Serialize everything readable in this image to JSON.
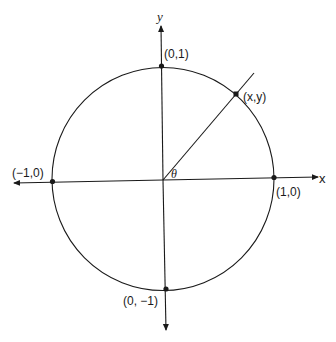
{
  "diagram": {
    "type": "unit-circle",
    "colors": {
      "stroke": "#1a1a1a",
      "background": "#ffffff"
    },
    "axes": {
      "x_label": "x",
      "y_label": "y"
    },
    "angle_label": "θ",
    "points": {
      "top": "(0,1)",
      "bottom": "(0, −1)",
      "left": "(−1,0)",
      "right": "(1,0)",
      "on_circle": "(x,y)"
    }
  }
}
